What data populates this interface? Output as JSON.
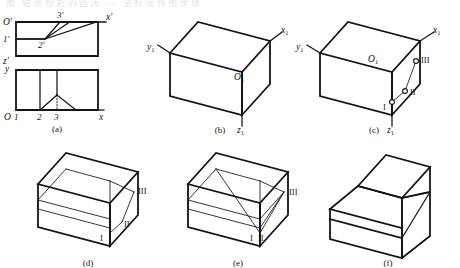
{
  "figure": {
    "title_strip": "图  轴测投影的画法  —  坐标法作图步骤",
    "captions": {
      "a": "(a)",
      "b": "(b)",
      "c": "(c)",
      "d": "(d)",
      "e": "(e)",
      "f": "(f)"
    }
  },
  "panel_a": {
    "name": "orthographic-views",
    "front_view": {
      "origin_label": "O′",
      "x_axis_label": "x′",
      "z_axis_label": "z′",
      "point_1": "1′",
      "point_2": "2′",
      "point_3": "3′"
    },
    "top_view": {
      "origin_label": "O",
      "x_axis_label": "x",
      "y_axis_label": "y",
      "tick_1": "1",
      "tick_2": "2",
      "tick_3": "3"
    }
  },
  "panel_b": {
    "name": "isometric-box-axes",
    "origin_label": "O",
    "origin_sub": "1",
    "x_label": "x",
    "x_sub": "1",
    "y_label": "y",
    "y_sub": "1",
    "z_label": "z",
    "z_sub": "1"
  },
  "panel_c": {
    "name": "isometric-points-plotted",
    "origin_label": "O",
    "origin_sub": "1",
    "x_label": "x",
    "x_sub": "1",
    "y_label": "y",
    "y_sub": "1",
    "z_label": "z",
    "z_sub": "1",
    "points": [
      {
        "id": "I",
        "label": "I"
      },
      {
        "id": "II",
        "label": "II"
      },
      {
        "id": "III",
        "label": "III"
      }
    ]
  },
  "panel_d": {
    "name": "isometric-construction-step-1",
    "points": [
      {
        "id": "I",
        "label": "I"
      },
      {
        "id": "II",
        "label": "II"
      },
      {
        "id": "III",
        "label": "III"
      }
    ]
  },
  "panel_e": {
    "name": "isometric-construction-step-2",
    "points": [
      {
        "id": "I",
        "label": "I"
      },
      {
        "id": "II",
        "label": "II"
      },
      {
        "id": "III",
        "label": "III"
      }
    ]
  },
  "panel_f": {
    "name": "finished-isometric-solid"
  }
}
